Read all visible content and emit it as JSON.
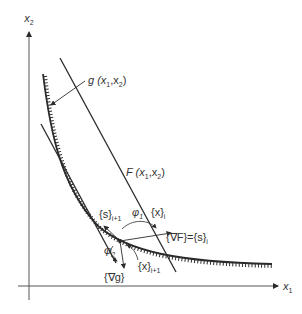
{
  "axes": {
    "x_label": "x",
    "x_sub": "1",
    "y_label": "x",
    "y_sub": "2"
  },
  "curves": {
    "constraint": {
      "name": "g",
      "label": "g (x",
      "label_sub1": "1",
      "label_mid": ",x",
      "label_sub2": "2",
      "label_end": ")"
    },
    "objective": {
      "name": "F",
      "label": "F (x",
      "label_sub1": "1",
      "label_mid": ",x",
      "label_sub2": "2",
      "label_end": ")"
    }
  },
  "annotations": {
    "s_next": "{s}",
    "s_next_sub": "i+1",
    "phi1": "φ",
    "phi1_sub": "1",
    "phi2": "φ",
    "phi2_sub": "2",
    "x_i": "{x}",
    "x_i_sub": "i",
    "gradF": "{∇F}={s}",
    "gradF_sub": "i",
    "x_next": "{x}",
    "x_next_sub": "i+1",
    "grad_g": "{∇g}"
  },
  "colors": {
    "ink": "#2b2b2b",
    "axis": "#555555",
    "background": "#ffffff"
  }
}
